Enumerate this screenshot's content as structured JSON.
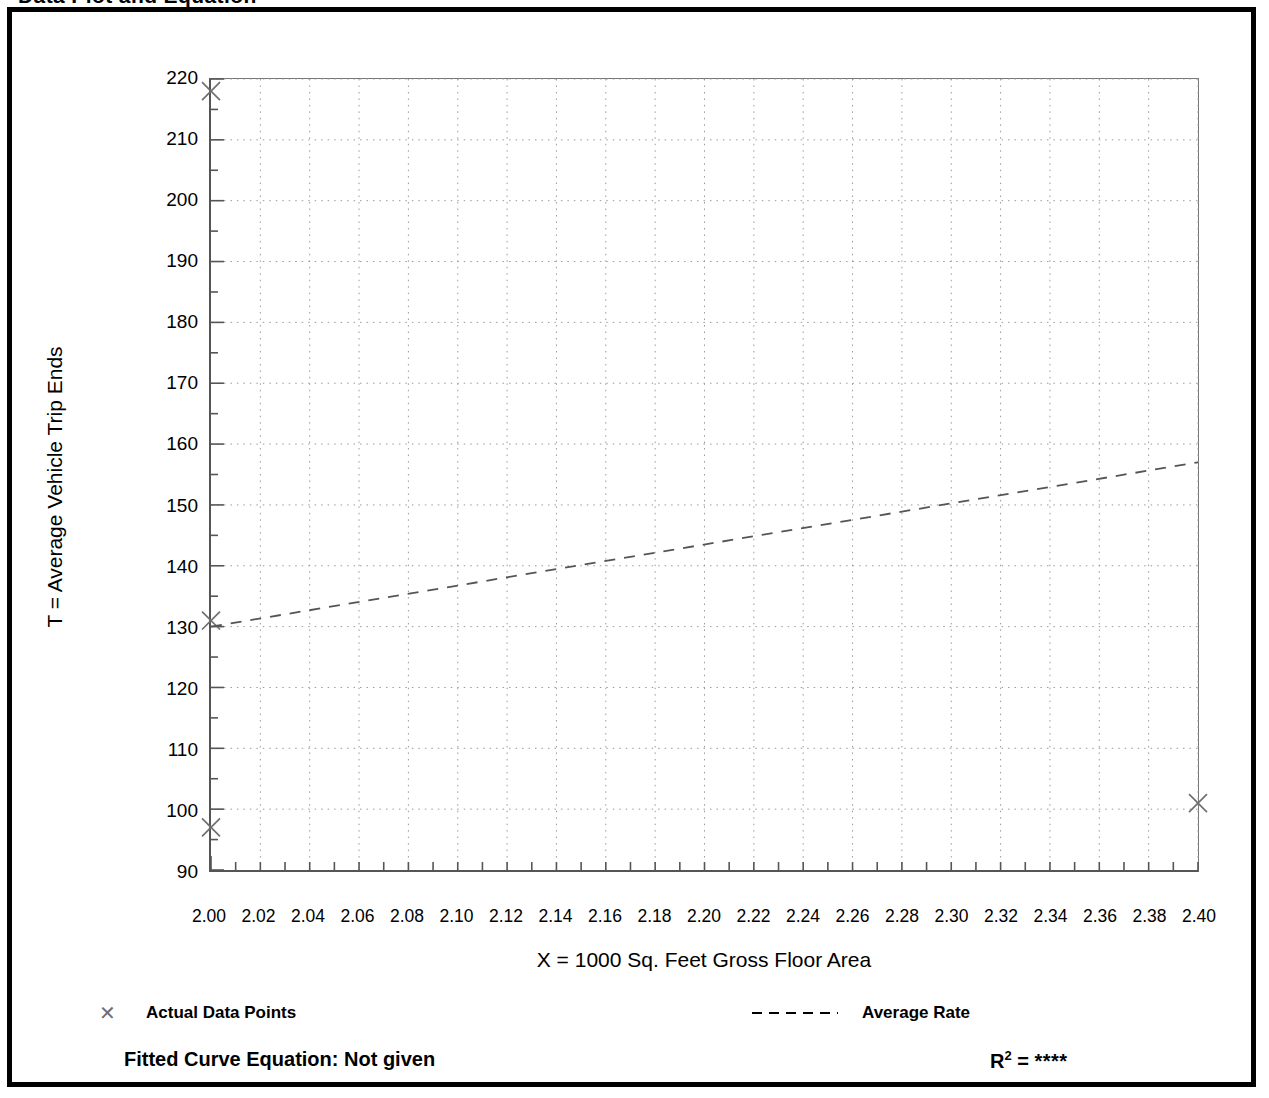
{
  "page": {
    "title": "Data Plot and Equation"
  },
  "chart_data": {
    "type": "scatter",
    "title": "Data Plot and Equation",
    "xlabel": "X = 1000 Sq. Feet Gross Floor Area",
    "ylabel": "T = Average Vehicle Trip Ends",
    "xlim": [
      2.0,
      2.4
    ],
    "ylim": [
      90,
      220
    ],
    "grid": true,
    "x_tick_step": 0.02,
    "y_tick_step": 10,
    "x_minor_step": 0.01,
    "y_minor_step": 5,
    "xticks": [
      "2.00",
      "2.02",
      "2.04",
      "2.06",
      "2.08",
      "2.10",
      "2.12",
      "2.14",
      "2.16",
      "2.18",
      "2.20",
      "2.22",
      "2.24",
      "2.26",
      "2.28",
      "2.30",
      "2.32",
      "2.34",
      "2.36",
      "2.38",
      "2.40"
    ],
    "yticks": [
      "90",
      "100",
      "110",
      "120",
      "130",
      "140",
      "150",
      "160",
      "170",
      "180",
      "190",
      "200",
      "210",
      "220"
    ],
    "series": [
      {
        "name": "Actual Data Points",
        "marker": "x",
        "type": "scatter",
        "points": [
          {
            "x": 2.0,
            "y": 218
          },
          {
            "x": 2.0,
            "y": 131
          },
          {
            "x": 2.0,
            "y": 97
          },
          {
            "x": 2.4,
            "y": 101
          }
        ]
      },
      {
        "name": "Average Rate",
        "type": "line",
        "style": "dashed",
        "points": [
          {
            "x": 2.0,
            "y": 130
          },
          {
            "x": 2.4,
            "y": 157
          }
        ]
      }
    ],
    "legend_position": "below-axes",
    "annotations": {
      "fitted_curve_equation": "Fitted Curve Equation:  Not given",
      "r_squared": "****"
    }
  },
  "legend": {
    "points_label": "Actual Data Points",
    "line_label": "Average Rate",
    "marker_glyph": "✕"
  },
  "footer": {
    "equation_label": "Fitted Curve Equation:  Not given",
    "r_label": "R",
    "r_exponent": "2",
    "r_equals": " = ",
    "r_value": "****"
  },
  "colors": {
    "axis": "#555555",
    "grid": "#999999",
    "marker": "#6f6f6f",
    "line": "#555555",
    "text": "#000000",
    "frame": "#000000"
  }
}
